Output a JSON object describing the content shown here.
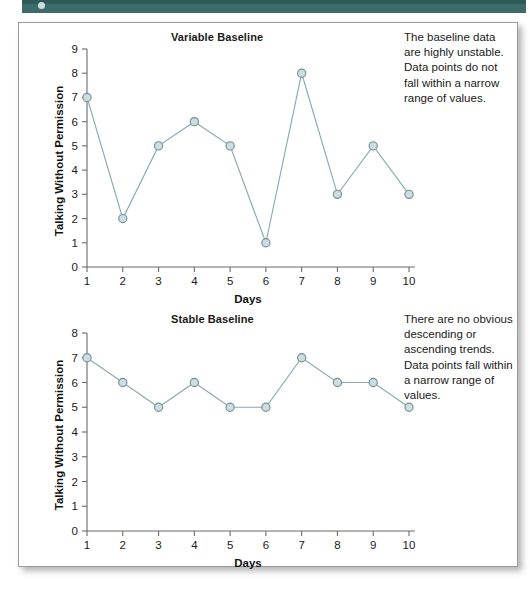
{
  "page": {
    "band_color": "#3b6b6b",
    "panel_bg": "#ffffff"
  },
  "figures": [
    {
      "title": "Variable Baseline",
      "annotation": "The baseline data are highly unstable. Data points do not fall within a narrow range of values.",
      "ylabel": "Talking Without Permission",
      "xlabel": "Days"
    },
    {
      "title": "Stable Baseline",
      "annotation": "There are no obvious descending or ascending trends. Data points fall within a narrow range of values.",
      "ylabel": "Talking Without Permission",
      "xlabel": "Days"
    }
  ],
  "chart_data": [
    {
      "type": "line",
      "title": "Variable Baseline",
      "xlabel": "Days",
      "ylabel": "Talking Without Permission",
      "x": [
        1,
        2,
        3,
        4,
        5,
        6,
        7,
        8,
        9,
        10
      ],
      "categories": [
        "1",
        "2",
        "3",
        "4",
        "5",
        "6",
        "7",
        "8",
        "9",
        "10"
      ],
      "values": [
        7,
        2,
        5,
        6,
        5,
        1,
        8,
        3,
        5,
        3
      ],
      "ylim": [
        0,
        9
      ],
      "yticks": [
        0,
        1,
        2,
        3,
        4,
        5,
        6,
        7,
        8,
        9
      ],
      "xlim": [
        1,
        10
      ],
      "grid": false,
      "legend": false,
      "marker": "circle",
      "line_color": "#8aa9ad",
      "marker_fill": "#cfdde0",
      "marker_stroke": "#6f9298",
      "annotation": "The baseline data are highly unstable. Data points do not fall within a narrow range of values."
    },
    {
      "type": "line",
      "title": "Stable Baseline",
      "xlabel": "Days",
      "ylabel": "Talking Without Permission",
      "x": [
        1,
        2,
        3,
        4,
        5,
        6,
        7,
        8,
        9,
        10
      ],
      "categories": [
        "1",
        "2",
        "3",
        "4",
        "5",
        "6",
        "7",
        "8",
        "9",
        "10"
      ],
      "values": [
        7,
        6,
        5,
        6,
        5,
        5,
        7,
        6,
        6,
        5
      ],
      "ylim": [
        0,
        8
      ],
      "yticks": [
        0,
        1,
        2,
        3,
        4,
        5,
        6,
        7,
        8
      ],
      "xlim": [
        1,
        10
      ],
      "grid": false,
      "legend": false,
      "marker": "circle",
      "line_color": "#8aa9ad",
      "marker_fill": "#cfdde0",
      "marker_stroke": "#6f9298",
      "annotation": "There are no obvious descending or ascending trends. Data points fall within a narrow range of values."
    }
  ]
}
